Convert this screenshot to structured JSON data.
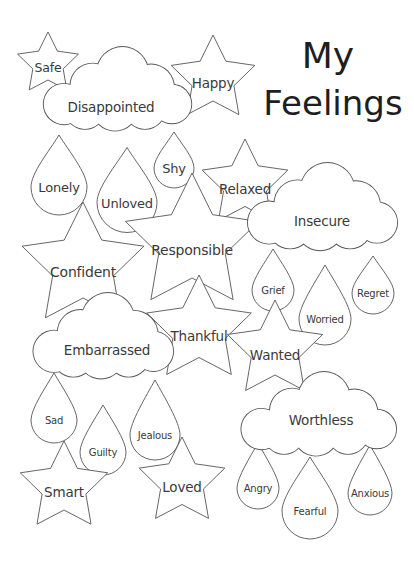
{
  "title": {
    "line1": "My",
    "line2": "Feelings"
  },
  "colors": {
    "outline": "#555555",
    "text": "#3a3a3a",
    "title": "#1e1e1e",
    "background": "#ffffff"
  },
  "stars": [
    {
      "label": "Safe",
      "cx": 48,
      "cy": 64,
      "r": 32
    },
    {
      "label": "Happy",
      "cx": 213,
      "cy": 79,
      "r": 44
    },
    {
      "label": "Relaxed",
      "cx": 245,
      "cy": 184,
      "r": 45
    },
    {
      "label": "Confident",
      "cx": 83,
      "cy": 266,
      "r": 64
    },
    {
      "label": "Responsible",
      "cx": 192,
      "cy": 243,
      "r": 70
    },
    {
      "label": "Thankful",
      "cx": 199,
      "cy": 330,
      "r": 55
    },
    {
      "label": "Wanted",
      "cx": 275,
      "cy": 350,
      "r": 50
    },
    {
      "label": "Smart",
      "cx": 64,
      "cy": 487,
      "r": 46
    },
    {
      "label": "Loved",
      "cx": 182,
      "cy": 482,
      "r": 45
    }
  ],
  "clouds": [
    {
      "label": "Disappointed",
      "x": 40,
      "y": 47,
      "w": 150,
      "h": 92,
      "text_x": 111,
      "text_y": 107
    },
    {
      "label": "Insecure",
      "x": 245,
      "y": 163,
      "w": 150,
      "h": 96,
      "text_x": 322,
      "text_y": 221
    },
    {
      "label": "Embarrassed",
      "x": 32,
      "y": 293,
      "w": 138,
      "h": 94,
      "text_x": 107,
      "text_y": 350
    },
    {
      "label": "Worthless",
      "x": 236,
      "y": 372,
      "w": 160,
      "h": 92,
      "text_x": 321,
      "text_y": 420
    }
  ],
  "drops": [
    {
      "label": "Lonely",
      "cx": 59,
      "cy": 175,
      "w": 56,
      "h": 80,
      "size": 13
    },
    {
      "label": "Unloved",
      "cx": 127,
      "cy": 190,
      "w": 60,
      "h": 85,
      "size": 13
    },
    {
      "label": "Shy",
      "cx": 174,
      "cy": 160,
      "w": 40,
      "h": 56,
      "size": 13
    },
    {
      "label": "Grief",
      "cx": 273,
      "cy": 280,
      "w": 42,
      "h": 62,
      "size": 10
    },
    {
      "label": "Worried",
      "cx": 325,
      "cy": 305,
      "w": 52,
      "h": 80,
      "size": 10
    },
    {
      "label": "Regret",
      "cx": 373,
      "cy": 285,
      "w": 42,
      "h": 58,
      "size": 10
    },
    {
      "label": "Sad",
      "cx": 54,
      "cy": 408,
      "w": 46,
      "h": 70,
      "size": 10
    },
    {
      "label": "Guilty",
      "cx": 103,
      "cy": 440,
      "w": 46,
      "h": 70,
      "size": 10
    },
    {
      "label": "Jealous",
      "cx": 155,
      "cy": 420,
      "w": 50,
      "h": 80,
      "size": 10
    },
    {
      "label": "Angry",
      "cx": 258,
      "cy": 476,
      "w": 42,
      "h": 66,
      "size": 10
    },
    {
      "label": "Fearful",
      "cx": 310,
      "cy": 498,
      "w": 56,
      "h": 82,
      "size": 10
    },
    {
      "label": "Anxious",
      "cx": 370,
      "cy": 480,
      "w": 44,
      "h": 70,
      "size": 10
    }
  ],
  "labels": {
    "stars": [
      "Safe",
      "Happy",
      "Relaxed",
      "Confident",
      "Responsible",
      "Thankful",
      "Wanted",
      "Smart",
      "Loved"
    ],
    "clouds": [
      "Disappointed",
      "Insecure",
      "Embarrassed",
      "Worthless"
    ],
    "drops": [
      "Lonely",
      "Unloved",
      "Shy",
      "Grief",
      "Worried",
      "Regret",
      "Sad",
      "Guilty",
      "Jealous",
      "Angry",
      "Fearful",
      "Anxious"
    ]
  }
}
